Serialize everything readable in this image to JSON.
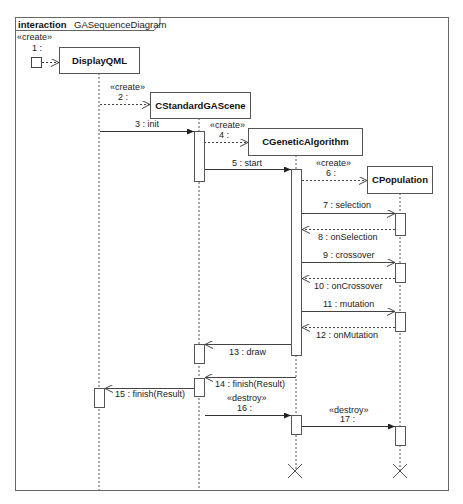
{
  "frame": {
    "keyword": "interaction",
    "name": "GASequenceDiagram"
  },
  "lifelines": [
    {
      "id": "display",
      "name": "DisplayQML"
    },
    {
      "id": "scene",
      "name": "CStandardGAScene"
    },
    {
      "id": "ga",
      "name": "CGeneticAlgorithm"
    },
    {
      "id": "pop",
      "name": "CPopulation"
    }
  ],
  "messages": [
    {
      "n": 1,
      "label": "1 :",
      "stereotype": "«create»",
      "from": "found",
      "to": "DisplayQML",
      "kind": "create"
    },
    {
      "n": 2,
      "label": "2 :",
      "stereotype": "«create»",
      "from": "DisplayQML",
      "to": "CStandardGAScene",
      "kind": "create"
    },
    {
      "n": 3,
      "label": "3 : init",
      "from": "DisplayQML",
      "to": "CStandardGAScene",
      "kind": "sync"
    },
    {
      "n": 4,
      "label": "4 :",
      "stereotype": "«create»",
      "from": "CStandardGAScene",
      "to": "CGeneticAlgorithm",
      "kind": "create"
    },
    {
      "n": 5,
      "label": "5 : start",
      "from": "CStandardGAScene",
      "to": "CGeneticAlgorithm",
      "kind": "sync"
    },
    {
      "n": 6,
      "label": "6 :",
      "stereotype": "«create»",
      "from": "CGeneticAlgorithm",
      "to": "CPopulation",
      "kind": "create"
    },
    {
      "n": 7,
      "label": "7 : selection",
      "from": "CGeneticAlgorithm",
      "to": "CPopulation",
      "kind": "async"
    },
    {
      "n": 8,
      "label": "8 : onSelection",
      "from": "CPopulation",
      "to": "CGeneticAlgorithm",
      "kind": "reply"
    },
    {
      "n": 9,
      "label": "9 : crossover",
      "from": "CGeneticAlgorithm",
      "to": "CPopulation",
      "kind": "async"
    },
    {
      "n": 10,
      "label": "10 : onCrossover",
      "from": "CPopulation",
      "to": "CGeneticAlgorithm",
      "kind": "reply"
    },
    {
      "n": 11,
      "label": "11 : mutation",
      "from": "CGeneticAlgorithm",
      "to": "CPopulation",
      "kind": "async"
    },
    {
      "n": 12,
      "label": "12 : onMutation",
      "from": "CPopulation",
      "to": "CGeneticAlgorithm",
      "kind": "reply"
    },
    {
      "n": 13,
      "label": "13 : draw",
      "from": "CGeneticAlgorithm",
      "to": "CStandardGAScene",
      "kind": "async"
    },
    {
      "n": 14,
      "label": "14 : finish(Result)",
      "from": "CGeneticAlgorithm",
      "to": "CStandardGAScene",
      "kind": "async"
    },
    {
      "n": 15,
      "label": "15 : finish(Result)",
      "from": "CStandardGAScene",
      "to": "DisplayQML",
      "kind": "async"
    },
    {
      "n": 16,
      "label": "16 :",
      "stereotype": "«destroy»",
      "from": "CStandardGAScene",
      "to": "CGeneticAlgorithm",
      "kind": "sync"
    },
    {
      "n": 17,
      "label": "17 :",
      "stereotype": "«destroy»",
      "from": "CGeneticAlgorithm",
      "to": "CPopulation",
      "kind": "sync"
    }
  ],
  "colors": {
    "line": "#555555",
    "text": "#222222",
    "background": "#ffffff"
  }
}
